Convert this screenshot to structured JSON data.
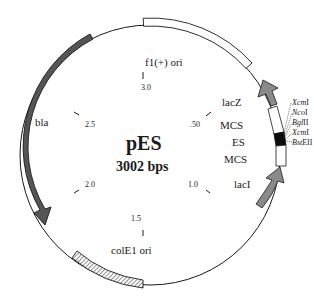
{
  "plasmid": {
    "name": "pES",
    "size_label": "3002 bps"
  },
  "features": {
    "f1_ori": "f1(+) ori",
    "lacZ": "lacZ",
    "mcs_top": "MCS",
    "es": "ES",
    "mcs_bottom": "MCS",
    "lacI": "lacI",
    "colE1_ori": "colE1 ori",
    "bla": "bla"
  },
  "ticks": {
    "t050": ".50",
    "t10": "1.0",
    "t15": "1.5",
    "t20": "2.0",
    "t25": "2.5",
    "t30": "3.0"
  },
  "restriction_sites": [
    {
      "name": "XcmI",
      "italic": "Xcm",
      "suffix": "I"
    },
    {
      "name": "NcoI",
      "italic": "Nco",
      "suffix": "I"
    },
    {
      "name": "BglII",
      "italic": "Bgl",
      "suffix": "II"
    },
    {
      "name": "XcmI",
      "italic": "Xcm",
      "suffix": "I"
    },
    {
      "name": "BstEII",
      "italic": "Bst",
      "suffix": "EII"
    }
  ],
  "colors": {
    "backbone": "#1a1a1a",
    "bla_fill": "#555555",
    "lac_arrow_fill": "#8a8a8a",
    "es_fill": "#0d0d0d",
    "box_fill": "#ffffff"
  }
}
